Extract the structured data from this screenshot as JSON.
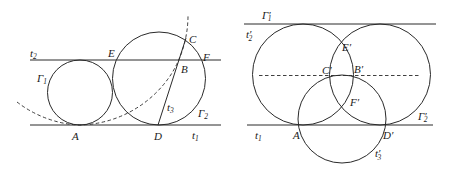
{
  "colors": {
    "stroke": "#2a2a2a",
    "text": "#1a1a1a",
    "background": "#ffffff"
  },
  "left_figure": {
    "labels": {
      "t2": "t",
      "t2_sub": "2",
      "E": "E",
      "C": "C",
      "F": "F",
      "B": "B",
      "Gamma1": "Γ",
      "Gamma1_sub": "1",
      "t3": "t",
      "t3_sub": "3",
      "Gamma2": "Γ",
      "Gamma2_sub": "2",
      "A": "A",
      "D": "D",
      "t1": "t",
      "t1_sub": "1"
    }
  },
  "right_figure": {
    "labels": {
      "Gamma1p": "Γ′",
      "Gamma1p_sub": "1",
      "t2p": "t′",
      "t2p_sub": "2",
      "Ep": "E′",
      "Cp": "C′",
      "Bp": "B′",
      "Fp": "F′",
      "Gamma2p": "Γ′",
      "Gamma2p_sub": "2",
      "t1": "t",
      "t1_sub": "1",
      "A": "A",
      "Dp": "D′",
      "t3p": "t′",
      "t3p_sub": "3"
    }
  }
}
